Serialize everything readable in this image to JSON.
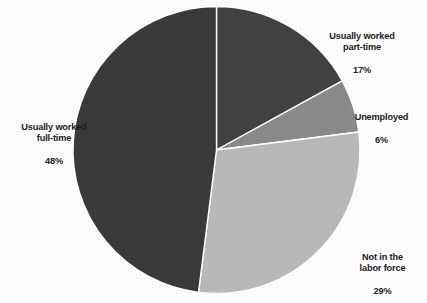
{
  "chart_data": {
    "type": "pie",
    "title": "",
    "subtitle": "",
    "xlabel": "",
    "ylabel": "",
    "legend_position": "none",
    "grid": false,
    "start_angle_deg": 0,
    "direction": "clockwise",
    "categories": [
      "Usually worked part-time",
      "Unemployed",
      "Not in the labor force",
      "Usually worked full-time"
    ],
    "values": [
      17,
      6,
      29,
      48
    ],
    "value_unit": "percent",
    "colors": [
      "#424242",
      "#8a8a8a",
      "#b9b9b9",
      "#3a3a3a"
    ],
    "slices": [
      {
        "label": "Usually worked part-time",
        "label_line1": "Usually worked",
        "label_line2": "part-time",
        "value": 17,
        "value_text": "17%",
        "color": "#424242",
        "start_deg": 0,
        "end_deg": 61.2
      },
      {
        "label": "Unemployed",
        "label_line1": "Unemployed",
        "label_line2": "",
        "value": 6,
        "value_text": "6%",
        "color": "#8a8a8a",
        "start_deg": 61.2,
        "end_deg": 82.8
      },
      {
        "label": "Not in the labor force",
        "label_line1": "Not in the",
        "label_line2": "labor force",
        "value": 29,
        "value_text": "29%",
        "color": "#b9b9b9",
        "start_deg": 82.8,
        "end_deg": 187.2
      },
      {
        "label": "Usually worked full-time",
        "label_line1": "Usually worked",
        "label_line2": "full-time",
        "value": 48,
        "value_text": "48%",
        "color": "#3a3a3a",
        "start_deg": 187.2,
        "end_deg": 360
      }
    ]
  },
  "labels": {
    "part_time": {
      "name": "Usually worked\npart-time",
      "pct": "17%"
    },
    "unemployed": {
      "name": "Unemployed",
      "pct": "6%"
    },
    "not_in_labor_force": {
      "name": "Not in the\nlabor force",
      "pct": "29%"
    },
    "full_time": {
      "name": "Usually worked\nfull-time",
      "pct": "48%"
    }
  },
  "style": {
    "slice_border_color": "#ffffff",
    "background_color": "#fdfdfd",
    "text_color": "#1c1c1c"
  }
}
